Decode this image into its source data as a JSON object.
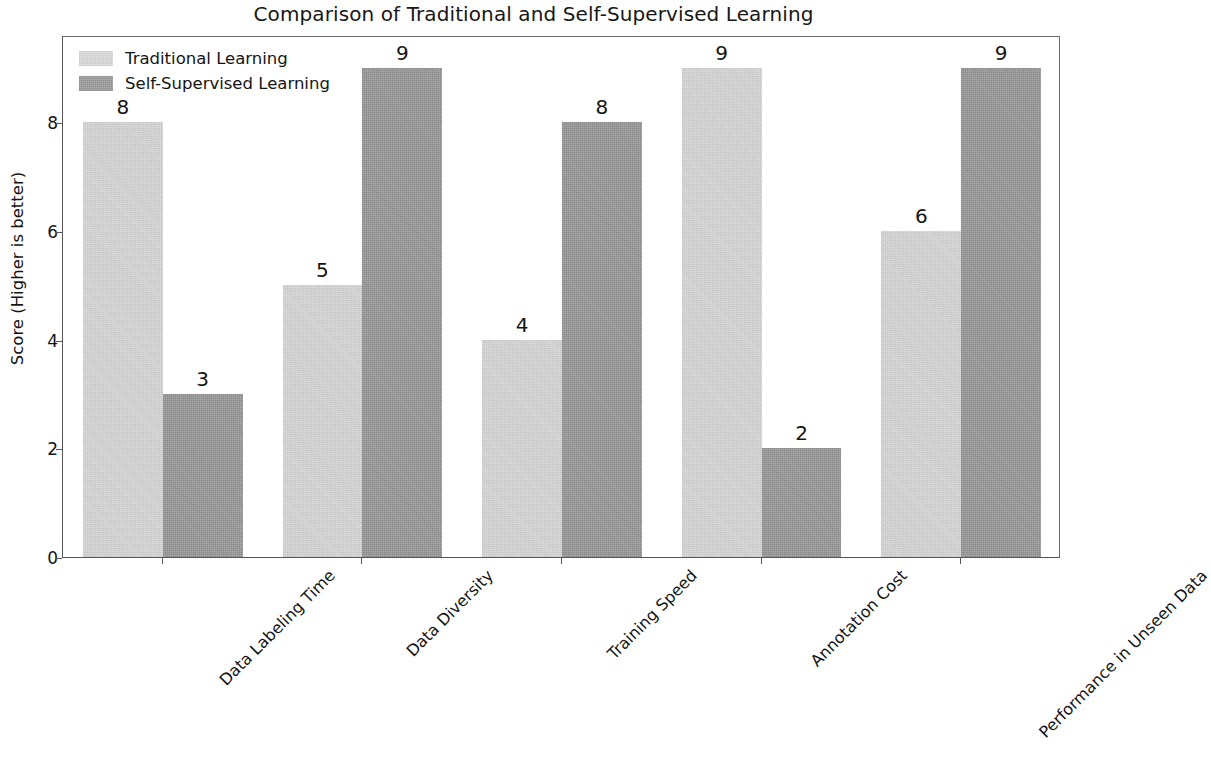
{
  "chart_data": {
    "type": "bar",
    "title": "Comparison of Traditional and Self-Supervised Learning",
    "xlabel": "",
    "ylabel": "Score (Higher is better)",
    "categories": [
      "Data Labeling Time",
      "Data Diversity",
      "Training Speed",
      "Annotation Cost",
      "Performance in Unseen Data"
    ],
    "series": [
      {
        "name": "Traditional Learning",
        "color": "#d9d9d9",
        "values": [
          8,
          5,
          4,
          9,
          6
        ]
      },
      {
        "name": "Self-Supervised Learning",
        "color": "#9c9c9c",
        "values": [
          3,
          9,
          8,
          2,
          9
        ]
      }
    ],
    "ylim": [
      0,
      9.6
    ],
    "yticks": [
      0,
      2,
      4,
      6,
      8
    ],
    "ytick_labels": [
      "0",
      "2",
      "4",
      "6",
      "8"
    ],
    "grid": false,
    "legend_position": "upper left",
    "bar_labels": true,
    "xtick_rotation": -45
  },
  "legend": {
    "items": [
      {
        "label": "Traditional Learning",
        "swatch": "traditional"
      },
      {
        "label": "Self-Supervised Learning",
        "swatch": "selfsup"
      }
    ]
  }
}
